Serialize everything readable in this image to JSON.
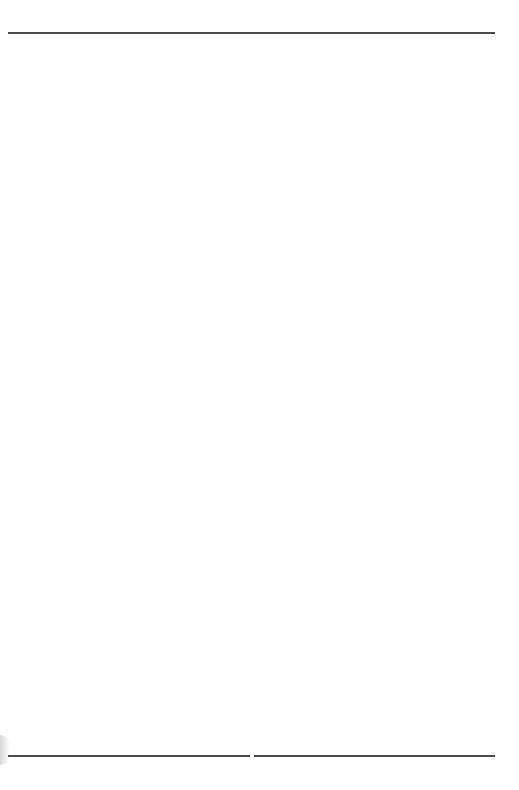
{
  "page": {
    "type": "lined-notebook-page",
    "page_number": "15",
    "ruled_line_count": 26,
    "colors": {
      "thick_rule": "#4a4a4a",
      "thin_rule": "#9a9a9a",
      "background": "#ffffff"
    }
  }
}
